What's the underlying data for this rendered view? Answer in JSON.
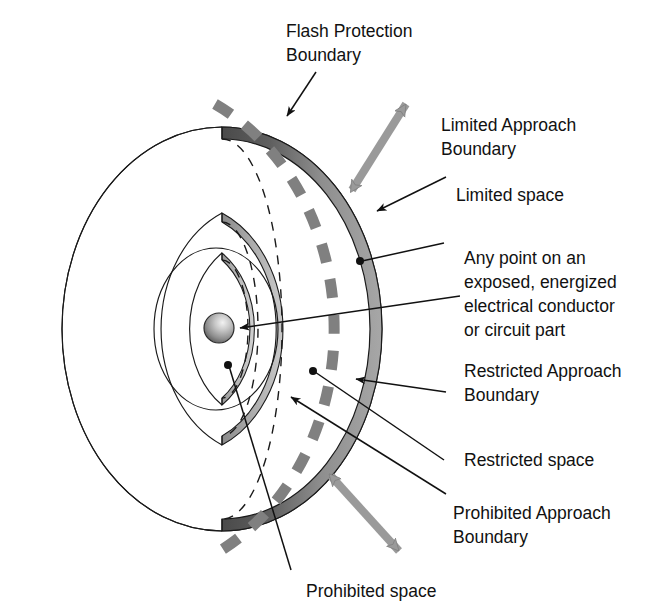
{
  "diagram": {
    "background_color": "#ffffff",
    "ink_color": "#111111",
    "band_dark_color": "#595959",
    "band_mid_color": "#8c8c8c",
    "band_light_color": "#b3b3b3",
    "dashed_boundary_color": "#808080",
    "arrow_gray_color": "#9a9a9a",
    "labels": {
      "flash_protection_boundary": {
        "line1": "Flash Protection",
        "line2": "Boundary"
      },
      "limited_approach_boundary": {
        "line1": "Limited Approach",
        "line2": "Boundary"
      },
      "limited_space": {
        "line1": "Limited space"
      },
      "any_point": {
        "line1": "Any point on an",
        "line2": "exposed, energized",
        "line3": "electrical conductor",
        "line4": "or circuit part"
      },
      "restricted_approach_boundary": {
        "line1": "Restricted Approach",
        "line2": "Boundary"
      },
      "restricted_space": {
        "line1": "Restricted space"
      },
      "prohibited_approach_boundary": {
        "line1": "Prohibited Approach",
        "line2": "Boundary"
      },
      "prohibited_space": {
        "line1": "Prohibited space"
      }
    },
    "regions": [
      {
        "name": "flash-protection-boundary",
        "style": "dashed-arc",
        "order": 1
      },
      {
        "name": "limited-approach-boundary",
        "style": "thick-shaded-band",
        "order": 2
      },
      {
        "name": "restricted-approach-boundary",
        "style": "medium-shaded-band",
        "order": 3
      },
      {
        "name": "prohibited-approach-boundary",
        "style": "thin-shaded-band",
        "order": 4
      },
      {
        "name": "energized-conductor",
        "style": "sphere",
        "order": 5
      }
    ]
  }
}
